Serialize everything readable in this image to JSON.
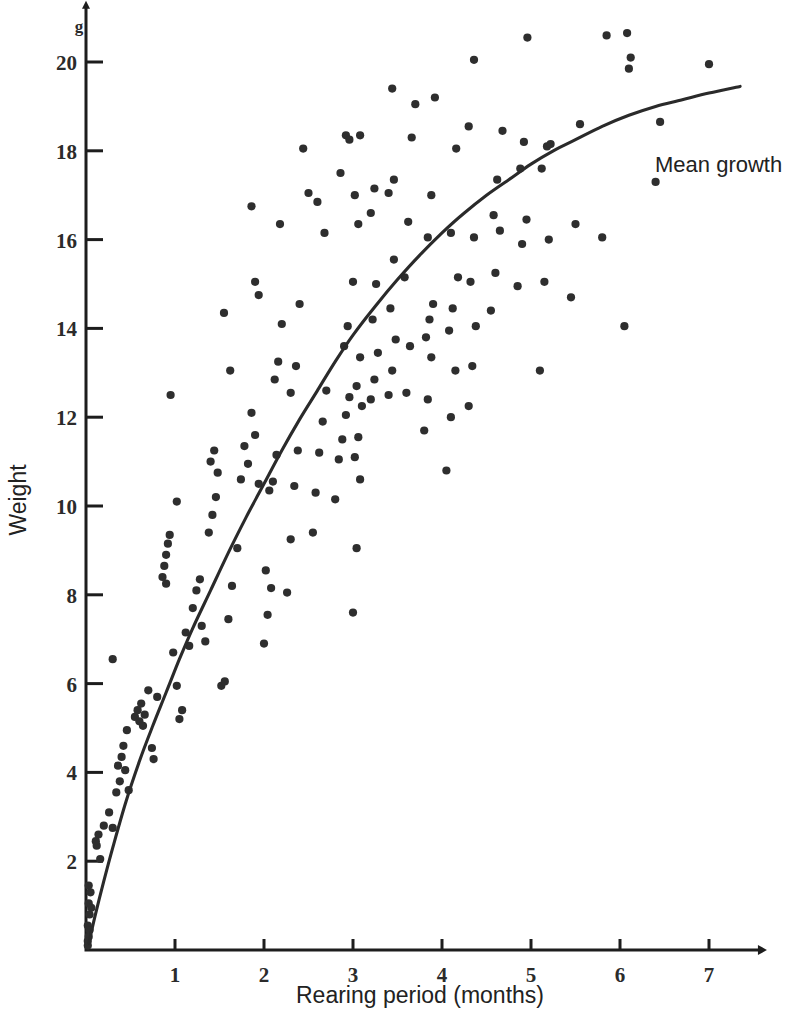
{
  "chart_data": {
    "type": "scatter",
    "title": "",
    "xlabel": "Rearing period (months)",
    "ylabel": "Weight",
    "y_unit": "g",
    "xlim": [
      0,
      7.55
    ],
    "ylim": [
      0,
      21.2
    ],
    "x_ticks": [
      1,
      2,
      3,
      4,
      5,
      6,
      7
    ],
    "y_ticks": [
      2,
      4,
      6,
      8,
      10,
      12,
      14,
      16,
      18,
      20
    ],
    "grid": false,
    "legend": "none",
    "annotations": [
      {
        "text": "Mean growth",
        "x": 5.95,
        "y": 17.3,
        "points_to_series": "mean-growth-curve"
      }
    ],
    "series": [
      {
        "name": "mean-growth-curve",
        "type": "line",
        "label": "Mean growth",
        "points": [
          [
            0.03,
            0.15
          ],
          [
            0.1,
            0.75
          ],
          [
            0.2,
            1.55
          ],
          [
            0.3,
            2.3
          ],
          [
            0.45,
            3.35
          ],
          [
            0.6,
            4.25
          ],
          [
            0.75,
            5.05
          ],
          [
            0.9,
            5.8
          ],
          [
            1.05,
            6.55
          ],
          [
            1.2,
            7.25
          ],
          [
            1.4,
            8.1
          ],
          [
            1.6,
            8.95
          ],
          [
            1.8,
            9.75
          ],
          [
            2.0,
            10.5
          ],
          [
            2.2,
            11.25
          ],
          [
            2.4,
            11.95
          ],
          [
            2.6,
            12.6
          ],
          [
            2.8,
            13.25
          ],
          [
            3.0,
            13.85
          ],
          [
            3.25,
            14.5
          ],
          [
            3.5,
            15.1
          ],
          [
            3.75,
            15.65
          ],
          [
            4.0,
            16.15
          ],
          [
            4.25,
            16.6
          ],
          [
            4.5,
            17.0
          ],
          [
            4.75,
            17.35
          ],
          [
            5.0,
            17.7
          ],
          [
            5.25,
            18.0
          ],
          [
            5.5,
            18.25
          ],
          [
            5.8,
            18.55
          ],
          [
            6.1,
            18.8
          ],
          [
            6.4,
            19.0
          ],
          [
            6.7,
            19.15
          ],
          [
            7.0,
            19.3
          ],
          [
            7.35,
            19.45
          ]
        ]
      },
      {
        "name": "observations",
        "type": "scatter",
        "marker": "filled-circle",
        "n": 191,
        "points": [
          [
            0.02,
            0.1
          ],
          [
            0.03,
            0.3
          ],
          [
            0.02,
            0.55
          ],
          [
            0.04,
            0.8
          ],
          [
            0.03,
            1.05
          ],
          [
            0.05,
            1.3
          ],
          [
            0.02,
            0.2
          ],
          [
            0.04,
            0.45
          ],
          [
            0.06,
            0.95
          ],
          [
            0.03,
            1.45
          ],
          [
            0.12,
            2.35
          ],
          [
            0.14,
            2.6
          ],
          [
            0.11,
            2.45
          ],
          [
            0.16,
            2.05
          ],
          [
            0.2,
            2.8
          ],
          [
            0.26,
            3.1
          ],
          [
            0.3,
            2.75
          ],
          [
            0.34,
            3.55
          ],
          [
            0.38,
            3.8
          ],
          [
            0.4,
            4.35
          ],
          [
            0.36,
            4.15
          ],
          [
            0.42,
            4.6
          ],
          [
            0.46,
            4.95
          ],
          [
            0.44,
            4.05
          ],
          [
            0.48,
            3.6
          ],
          [
            0.3,
            6.55
          ],
          [
            0.55,
            5.25
          ],
          [
            0.58,
            5.4
          ],
          [
            0.6,
            5.15
          ],
          [
            0.62,
            5.55
          ],
          [
            0.64,
            5.05
          ],
          [
            0.66,
            5.3
          ],
          [
            0.7,
            5.85
          ],
          [
            0.74,
            4.55
          ],
          [
            0.76,
            4.3
          ],
          [
            0.8,
            5.7
          ],
          [
            0.86,
            8.4
          ],
          [
            0.88,
            8.65
          ],
          [
            0.9,
            8.9
          ],
          [
            0.92,
            9.15
          ],
          [
            0.9,
            8.25
          ],
          [
            0.94,
            9.35
          ],
          [
            0.98,
            6.7
          ],
          [
            1.02,
            5.95
          ],
          [
            1.05,
            5.2
          ],
          [
            1.08,
            5.4
          ],
          [
            1.02,
            10.1
          ],
          [
            0.95,
            12.5
          ],
          [
            1.12,
            7.15
          ],
          [
            1.16,
            6.85
          ],
          [
            1.2,
            7.7
          ],
          [
            1.24,
            8.1
          ],
          [
            1.28,
            8.35
          ],
          [
            1.3,
            7.3
          ],
          [
            1.34,
            6.95
          ],
          [
            1.38,
            9.4
          ],
          [
            1.42,
            9.8
          ],
          [
            1.46,
            10.2
          ],
          [
            1.4,
            11.0
          ],
          [
            1.44,
            11.25
          ],
          [
            1.48,
            10.75
          ],
          [
            1.52,
            5.95
          ],
          [
            1.56,
            6.05
          ],
          [
            1.6,
            7.45
          ],
          [
            1.64,
            8.2
          ],
          [
            1.55,
            14.35
          ],
          [
            1.62,
            13.05
          ],
          [
            1.7,
            9.05
          ],
          [
            1.74,
            10.6
          ],
          [
            1.78,
            11.35
          ],
          [
            1.82,
            10.95
          ],
          [
            1.86,
            12.1
          ],
          [
            1.9,
            11.6
          ],
          [
            1.94,
            10.5
          ],
          [
            1.86,
            16.75
          ],
          [
            1.9,
            15.05
          ],
          [
            1.94,
            14.75
          ],
          [
            2.0,
            6.9
          ],
          [
            2.04,
            7.55
          ],
          [
            2.08,
            8.15
          ],
          [
            2.02,
            8.55
          ],
          [
            2.06,
            10.35
          ],
          [
            2.1,
            10.55
          ],
          [
            2.14,
            11.15
          ],
          [
            2.12,
            12.85
          ],
          [
            2.16,
            13.25
          ],
          [
            2.2,
            14.1
          ],
          [
            2.18,
            16.35
          ],
          [
            2.26,
            8.05
          ],
          [
            2.3,
            9.25
          ],
          [
            2.34,
            10.45
          ],
          [
            2.38,
            11.25
          ],
          [
            2.3,
            12.55
          ],
          [
            2.36,
            13.15
          ],
          [
            2.4,
            14.55
          ],
          [
            2.44,
            18.05
          ],
          [
            2.5,
            17.05
          ],
          [
            2.55,
            9.4
          ],
          [
            2.58,
            10.3
          ],
          [
            2.62,
            11.2
          ],
          [
            2.66,
            11.9
          ],
          [
            2.7,
            12.6
          ],
          [
            2.6,
            16.85
          ],
          [
            2.68,
            16.15
          ],
          [
            2.8,
            10.15
          ],
          [
            2.84,
            11.05
          ],
          [
            2.88,
            11.5
          ],
          [
            2.92,
            12.05
          ],
          [
            2.96,
            12.45
          ],
          [
            2.9,
            13.6
          ],
          [
            2.94,
            14.05
          ],
          [
            2.86,
            17.5
          ],
          [
            2.92,
            18.35
          ],
          [
            2.96,
            18.25
          ],
          [
            3.0,
            7.6
          ],
          [
            3.04,
            9.05
          ],
          [
            3.08,
            10.6
          ],
          [
            3.02,
            11.1
          ],
          [
            3.06,
            11.55
          ],
          [
            3.1,
            12.25
          ],
          [
            3.04,
            12.7
          ],
          [
            3.08,
            13.35
          ],
          [
            3.0,
            15.05
          ],
          [
            3.06,
            16.35
          ],
          [
            3.02,
            17.0
          ],
          [
            3.08,
            18.35
          ],
          [
            3.2,
            12.4
          ],
          [
            3.24,
            12.85
          ],
          [
            3.28,
            13.45
          ],
          [
            3.22,
            14.2
          ],
          [
            3.26,
            15.0
          ],
          [
            3.2,
            16.6
          ],
          [
            3.24,
            17.15
          ],
          [
            3.4,
            12.5
          ],
          [
            3.44,
            13.05
          ],
          [
            3.48,
            13.75
          ],
          [
            3.42,
            14.45
          ],
          [
            3.46,
            15.55
          ],
          [
            3.4,
            17.05
          ],
          [
            3.46,
            17.35
          ],
          [
            3.44,
            19.4
          ],
          [
            3.6,
            12.55
          ],
          [
            3.64,
            13.6
          ],
          [
            3.58,
            15.15
          ],
          [
            3.62,
            16.4
          ],
          [
            3.66,
            18.3
          ],
          [
            3.7,
            19.05
          ],
          [
            3.8,
            11.7
          ],
          [
            3.84,
            12.4
          ],
          [
            3.88,
            13.35
          ],
          [
            3.82,
            13.8
          ],
          [
            3.86,
            14.2
          ],
          [
            3.9,
            14.55
          ],
          [
            3.84,
            16.05
          ],
          [
            3.88,
            17.0
          ],
          [
            3.92,
            19.2
          ],
          [
            4.05,
            10.8
          ],
          [
            4.1,
            12.0
          ],
          [
            4.15,
            13.05
          ],
          [
            4.08,
            13.95
          ],
          [
            4.12,
            14.45
          ],
          [
            4.18,
            15.15
          ],
          [
            4.1,
            16.15
          ],
          [
            4.16,
            18.05
          ],
          [
            4.3,
            12.25
          ],
          [
            4.34,
            13.15
          ],
          [
            4.38,
            14.05
          ],
          [
            4.32,
            15.05
          ],
          [
            4.36,
            16.05
          ],
          [
            4.3,
            18.55
          ],
          [
            4.36,
            20.05
          ],
          [
            4.55,
            14.4
          ],
          [
            4.6,
            15.25
          ],
          [
            4.65,
            16.2
          ],
          [
            4.58,
            16.55
          ],
          [
            4.62,
            17.35
          ],
          [
            4.68,
            18.45
          ],
          [
            4.85,
            14.95
          ],
          [
            4.9,
            15.9
          ],
          [
            4.95,
            16.45
          ],
          [
            4.88,
            17.6
          ],
          [
            4.92,
            18.2
          ],
          [
            4.96,
            20.55
          ],
          [
            5.1,
            13.05
          ],
          [
            5.15,
            15.05
          ],
          [
            5.2,
            16.0
          ],
          [
            5.12,
            17.6
          ],
          [
            5.18,
            18.1
          ],
          [
            5.22,
            18.15
          ],
          [
            5.45,
            14.7
          ],
          [
            5.5,
            16.35
          ],
          [
            5.55,
            18.6
          ],
          [
            5.8,
            16.05
          ],
          [
            5.85,
            20.6
          ],
          [
            6.05,
            14.05
          ],
          [
            6.1,
            19.85
          ],
          [
            6.12,
            20.1
          ],
          [
            6.08,
            20.65
          ],
          [
            6.4,
            17.3
          ],
          [
            6.45,
            18.65
          ],
          [
            7.0,
            19.95
          ]
        ]
      }
    ]
  },
  "axes": {
    "y_unit_label": "g",
    "y_title": "Weight",
    "x_title": "Rearing period (months)"
  }
}
